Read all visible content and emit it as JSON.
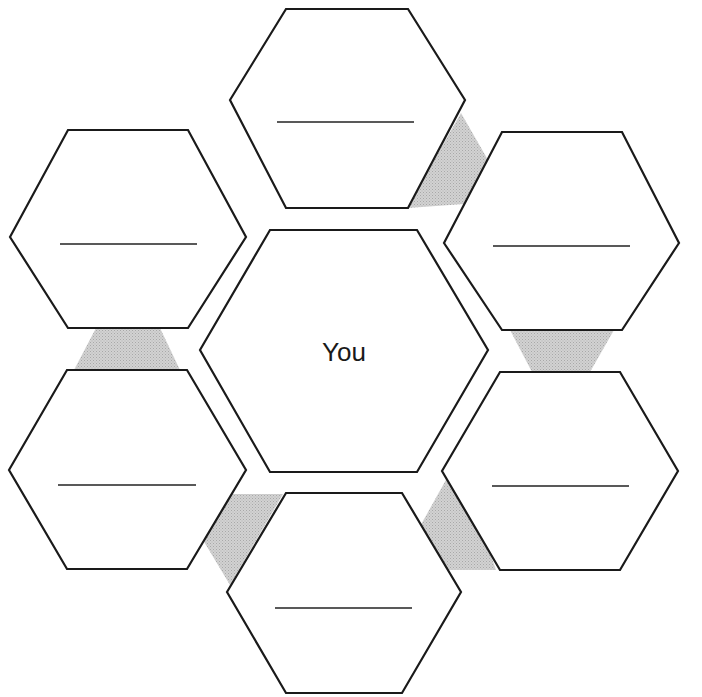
{
  "header": {
    "clipped_text_note": "Top text line cut off by crop; only descenders visible, words unreadable"
  },
  "diagram": {
    "type": "hexagon-relationship-map",
    "center": {
      "label": "You"
    },
    "outer_hexagons": [
      {
        "id": "top",
        "label": "",
        "write_in_line": true
      },
      {
        "id": "upper-right",
        "label": "",
        "write_in_line": true
      },
      {
        "id": "lower-right",
        "label": "",
        "write_in_line": true
      },
      {
        "id": "bottom",
        "label": "",
        "write_in_line": true
      },
      {
        "id": "lower-left",
        "label": "",
        "write_in_line": true
      },
      {
        "id": "upper-left",
        "label": "",
        "write_in_line": true
      }
    ],
    "connector_count": 6,
    "colors": {
      "stroke": "#1a1a1a",
      "fill": "#ffffff",
      "connector_shade": "#c8c8c8"
    }
  }
}
